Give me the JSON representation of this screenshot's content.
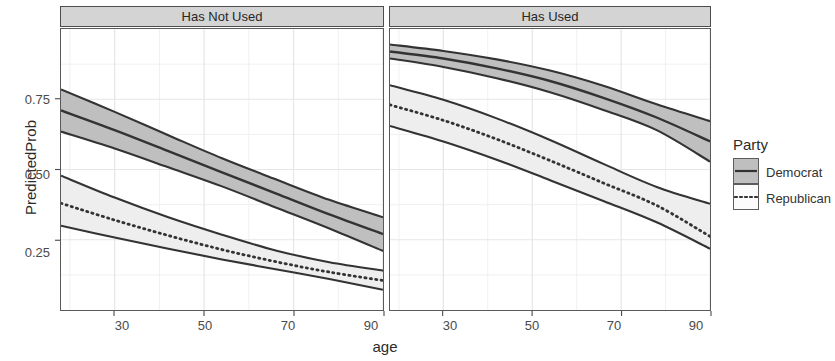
{
  "chart_data": {
    "type": "line",
    "title": "",
    "xlabel": "age",
    "ylabel": "PredictedProb",
    "xlim": [
      18,
      90
    ],
    "ylim": [
      0.0,
      1.0
    ],
    "grid": true,
    "xticks": [
      30,
      50,
      70,
      90
    ],
    "xtick_labels": [
      "30",
      "50",
      "70",
      "90"
    ],
    "yticks": [
      0.25,
      0.5,
      0.75
    ],
    "ytick_labels": [
      "0.25",
      "0.50",
      "0.75"
    ],
    "legend_title": "Party",
    "legend_position": "right",
    "facet_labels": [
      "Has Not Used",
      "Has Used"
    ],
    "x": [
      18,
      30,
      42,
      54,
      66,
      78,
      90
    ],
    "panels": [
      {
        "facet": "Has Not Used",
        "series": [
          {
            "name": "Democrat",
            "linetype": "solid",
            "fill": "#bfbfbf",
            "values": [
              0.71,
              0.64,
              0.565,
              0.49,
              0.415,
              0.34,
              0.27
            ],
            "lower": [
              0.635,
              0.575,
              0.508,
              0.44,
              0.365,
              0.29,
              0.21
            ],
            "upper": [
              0.785,
              0.705,
              0.622,
              0.54,
              0.465,
              0.392,
              0.33
            ]
          },
          {
            "name": "Republican",
            "linetype": "dotted",
            "fill": "#eeeeee",
            "values": [
              0.38,
              0.32,
              0.265,
              0.215,
              0.172,
              0.135,
              0.105
            ],
            "lower": [
              0.3,
              0.258,
              0.218,
              0.18,
              0.145,
              0.11,
              0.072
            ],
            "upper": [
              0.478,
              0.4,
              0.33,
              0.268,
              0.212,
              0.17,
              0.14
            ]
          }
        ]
      },
      {
        "facet": "Has Used",
        "series": [
          {
            "name": "Democrat",
            "linetype": "solid",
            "fill": "#bfbfbf",
            "values": [
              0.92,
              0.895,
              0.86,
              0.815,
              0.755,
              0.685,
              0.6
            ],
            "lower": [
              0.895,
              0.865,
              0.825,
              0.775,
              0.712,
              0.64,
              0.528
            ],
            "upper": [
              0.945,
              0.922,
              0.892,
              0.852,
              0.798,
              0.732,
              0.672
            ]
          },
          {
            "name": "Republican",
            "linetype": "dotted",
            "fill": "#eeeeee",
            "values": [
              0.73,
              0.675,
              0.608,
              0.532,
              0.452,
              0.372,
              0.262
            ],
            "lower": [
              0.655,
              0.6,
              0.535,
              0.462,
              0.388,
              0.312,
              0.218
            ],
            "upper": [
              0.8,
              0.748,
              0.682,
              0.605,
              0.52,
              0.438,
              0.378
            ]
          }
        ]
      }
    ]
  },
  "axes": {
    "y_title": "PredictedProb",
    "x_title": "age",
    "y_ticks": [
      "0.75",
      "0.50",
      "0.25"
    ],
    "x_ticks": [
      "30",
      "50",
      "70",
      "90"
    ]
  },
  "strips": {
    "left": "Has Not Used",
    "right": "Has Used"
  },
  "legend": {
    "title": "Party",
    "entries": [
      {
        "label": "Democrat",
        "linetype": "solid",
        "ribbon": "#bfbfbf"
      },
      {
        "label": "Republican",
        "linetype": "dotted",
        "ribbon": "#f2f2f2"
      }
    ]
  },
  "colors": {
    "line": "#333333",
    "ribbon_dark": "#bfbfbf",
    "ribbon_light": "#eeeeee",
    "strip_bg": "#d4d4d4",
    "grid": "#e8e8e8",
    "panel_border": "#5a5a5a"
  }
}
